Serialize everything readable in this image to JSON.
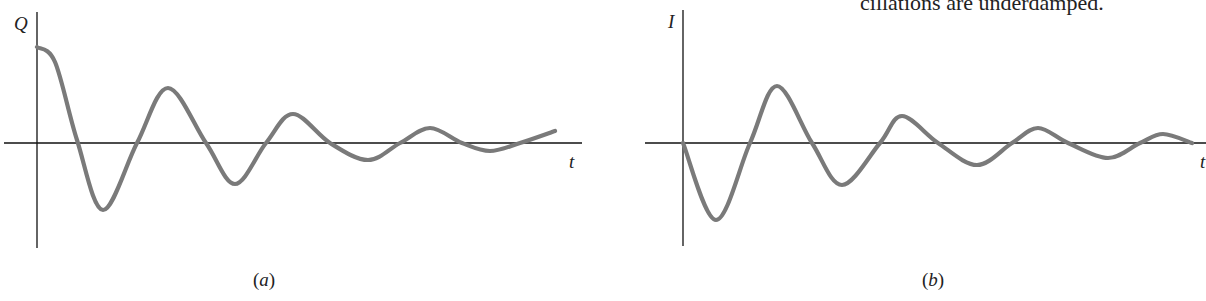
{
  "margin_note": "cillations are underdamped.",
  "chart_data": [
    {
      "type": "line",
      "panel": "(a)",
      "title": "",
      "xlabel": "t",
      "ylabel": "Q",
      "grid": false,
      "legend": null,
      "description": "Damped oscillation of charge Q starting at maximum",
      "axis_pixels": {
        "origin_x": 37,
        "origin_y": 143,
        "x_start": 4,
        "x_end": 582,
        "y_top": 12,
        "y_bottom": 248
      },
      "points_px": [
        [
          37,
          47
        ],
        [
          55,
          62
        ],
        [
          77,
          140
        ],
        [
          103,
          210
        ],
        [
          137,
          143
        ],
        [
          168,
          88
        ],
        [
          206,
          143
        ],
        [
          235,
          184
        ],
        [
          266,
          143
        ],
        [
          293,
          114
        ],
        [
          330,
          143
        ],
        [
          368,
          160
        ],
        [
          400,
          143
        ],
        [
          430,
          128
        ],
        [
          462,
          143
        ],
        [
          490,
          151
        ],
        [
          520,
          143
        ],
        [
          555,
          131
        ]
      ],
      "normalized": {
        "x": [
          0,
          1,
          2,
          3,
          4,
          5,
          6,
          7,
          8
        ],
        "y": [
          1.0,
          -0.7,
          0.57,
          -0.43,
          0.3,
          -0.18,
          0.16,
          -0.08,
          0.12
        ]
      }
    },
    {
      "type": "line",
      "panel": "(b)",
      "title": "",
      "xlabel": "t",
      "ylabel": "I",
      "grid": false,
      "legend": null,
      "description": "Damped oscillation of current I starting at zero",
      "axis_pixels": {
        "origin_x": 683,
        "origin_y": 143,
        "x_start": 645,
        "x_end": 1206,
        "y_top": 10,
        "y_bottom": 246
      },
      "points_px": [
        [
          683,
          143
        ],
        [
          716,
          220
        ],
        [
          750,
          143
        ],
        [
          777,
          86
        ],
        [
          812,
          143
        ],
        [
          842,
          185
        ],
        [
          880,
          143
        ],
        [
          902,
          116
        ],
        [
          938,
          143
        ],
        [
          977,
          165
        ],
        [
          1012,
          143
        ],
        [
          1038,
          128
        ],
        [
          1068,
          143
        ],
        [
          1108,
          158
        ],
        [
          1140,
          143
        ],
        [
          1163,
          134
        ],
        [
          1192,
          143
        ]
      ],
      "normalized": {
        "x": [
          0,
          1,
          2,
          3,
          4,
          5,
          6,
          7,
          8
        ],
        "y": [
          0,
          -0.8,
          0.59,
          -0.44,
          0.28,
          -0.23,
          0.16,
          -0.16,
          0.09
        ]
      }
    }
  ],
  "panels": {
    "a": {
      "ylabel": "Q",
      "xlabel": "t",
      "caption_open": "(",
      "caption_letter": "a",
      "caption_close": ")"
    },
    "b": {
      "ylabel": "I",
      "xlabel": "t",
      "caption_open": "(",
      "caption_letter": "b",
      "caption_close": ")"
    }
  },
  "style": {
    "curve_color": "#7a7a7a",
    "axis_color": "#111111"
  }
}
